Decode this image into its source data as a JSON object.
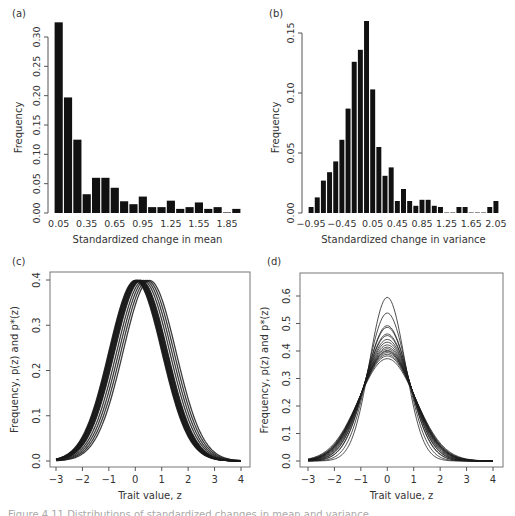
{
  "figure": {
    "caption": "Figure 4.11 Distributions of standardized changes in mean and variance"
  },
  "chart_data": [
    {
      "id": "a",
      "panel_label": "(a)",
      "type": "bar",
      "title": "",
      "xlabel": "Standardized change in mean",
      "ylabel": "Frequency",
      "ylim": [
        0,
        0.33
      ],
      "yticks": [
        0.0,
        0.05,
        0.1,
        0.15,
        0.2,
        0.25,
        0.3
      ],
      "ytick_labels": [
        "0.00",
        "0.05",
        "0.10",
        "0.15",
        "0.20",
        "0.25",
        "0.30"
      ],
      "xtick_labels": [
        "0.05",
        "0.35",
        "0.65",
        "0.95",
        "1.25",
        "1.55",
        "1.85"
      ],
      "xtick_every": 3,
      "grid": false,
      "categories": [
        "0.05",
        "0.15",
        "0.25",
        "0.35",
        "0.45",
        "0.55",
        "0.65",
        "0.75",
        "0.85",
        "0.95",
        "1.05",
        "1.15",
        "1.25",
        "1.35",
        "1.45",
        "1.55",
        "1.65",
        "1.75",
        "1.85",
        "1.95"
      ],
      "values": [
        0.325,
        0.197,
        0.125,
        0.032,
        0.06,
        0.06,
        0.043,
        0.02,
        0.015,
        0.028,
        0.01,
        0.01,
        0.021,
        0.007,
        0.01,
        0.018,
        0.007,
        0.01,
        0.001,
        0.007
      ],
      "bar_color": "#111111"
    },
    {
      "id": "b",
      "panel_label": "(b)",
      "type": "bar",
      "title": "",
      "xlabel": "Standardized change in variance",
      "ylabel": "Frequency",
      "ylim": [
        0,
        0.16
      ],
      "yticks": [
        0.0,
        0.05,
        0.1,
        0.15
      ],
      "ytick_labels": [
        "0.00",
        "0.05",
        "0.10",
        "0.15"
      ],
      "xtick_labels": [
        "−0.95",
        "−0.45",
        "0.05",
        "0.45",
        "0.85",
        "1.25",
        "1.65",
        "2.05"
      ],
      "xtick_positions": [
        0,
        5,
        10,
        14,
        18,
        22,
        26,
        30
      ],
      "grid": false,
      "categories": [
        "-0.95",
        "-0.85",
        "-0.75",
        "-0.65",
        "-0.55",
        "-0.45",
        "-0.35",
        "-0.25",
        "-0.15",
        "-0.05",
        "0.05",
        "0.15",
        "0.25",
        "0.35",
        "0.45",
        "0.55",
        "0.65",
        "0.75",
        "0.85",
        "0.95",
        "1.05",
        "1.15",
        "1.25",
        "1.35",
        "1.45",
        "1.55",
        "1.65",
        "1.75",
        "1.85",
        "1.95",
        "2.05"
      ],
      "values": [
        0.005,
        0.013,
        0.027,
        0.034,
        0.043,
        0.061,
        0.087,
        0.126,
        0.136,
        0.16,
        0.103,
        0.055,
        0.031,
        0.038,
        0.01,
        0.02,
        0.01,
        0.006,
        0.011,
        0.011,
        0.006,
        0.005,
        0.0,
        0.0,
        0.005,
        0.005,
        0.0,
        0.0,
        0.0,
        0.005,
        0.01
      ],
      "bar_color": "#111111"
    },
    {
      "id": "c",
      "panel_label": "(c)",
      "type": "line",
      "title": "",
      "xlabel": "Trait value, z",
      "ylabel": "Frequency, p(z) and p*(z)",
      "xlim": [
        -3,
        4
      ],
      "ylim": [
        0,
        0.4
      ],
      "xticks": [
        -3,
        -2,
        -1,
        0,
        1,
        2,
        3,
        4
      ],
      "xtick_labels": [
        "−3",
        "−2",
        "−1",
        "0",
        "1",
        "2",
        "3",
        "4"
      ],
      "yticks": [
        0.0,
        0.1,
        0.2,
        0.3,
        0.4
      ],
      "ytick_labels": [
        "0.0",
        "0.1",
        "0.2",
        "0.3",
        "0.4"
      ],
      "grid": false,
      "series_description": "Normal density curves with SD = 1 and shifted means",
      "series": [
        {
          "name": "curve",
          "mean": 0.0,
          "sd": 1.0
        },
        {
          "name": "curve",
          "mean": 0.02,
          "sd": 1.0
        },
        {
          "name": "curve",
          "mean": 0.04,
          "sd": 1.0
        },
        {
          "name": "curve",
          "mean": 0.05,
          "sd": 1.0
        },
        {
          "name": "curve",
          "mean": 0.06,
          "sd": 1.0
        },
        {
          "name": "curve",
          "mean": 0.08,
          "sd": 1.0
        },
        {
          "name": "curve",
          "mean": 0.1,
          "sd": 1.0
        },
        {
          "name": "curve",
          "mean": 0.12,
          "sd": 1.0
        },
        {
          "name": "curve",
          "mean": 0.14,
          "sd": 1.0
        },
        {
          "name": "curve",
          "mean": 0.16,
          "sd": 1.0
        },
        {
          "name": "curve",
          "mean": 0.18,
          "sd": 1.0
        },
        {
          "name": "curve",
          "mean": 0.2,
          "sd": 1.0
        },
        {
          "name": "curve",
          "mean": 0.22,
          "sd": 1.0
        },
        {
          "name": "curve",
          "mean": 0.3,
          "sd": 1.0
        },
        {
          "name": "curve",
          "mean": 0.38,
          "sd": 1.0
        },
        {
          "name": "curve",
          "mean": 0.46,
          "sd": 1.0
        },
        {
          "name": "curve",
          "mean": 0.54,
          "sd": 1.0
        }
      ]
    },
    {
      "id": "d",
      "panel_label": "(d)",
      "type": "line",
      "title": "",
      "xlabel": "Trait value, z",
      "ylabel": "Frequency, p(z) and p*(z)",
      "xlim": [
        -3,
        4
      ],
      "ylim": [
        0,
        0.6
      ],
      "xticks": [
        -3,
        -2,
        -1,
        0,
        1,
        2,
        3,
        4
      ],
      "xtick_labels": [
        "−3",
        "−2",
        "−1",
        "0",
        "1",
        "2",
        "3",
        "4"
      ],
      "yticks": [
        0.0,
        0.1,
        0.2,
        0.3,
        0.4,
        0.5,
        0.6
      ],
      "ytick_labels": [
        "0.0",
        "0.1",
        "0.2",
        "0.3",
        "0.4",
        "0.5",
        "0.6"
      ],
      "grid": false,
      "series_description": "Normal density curves centered at 0 with varying peak heights",
      "series": [
        {
          "name": "curve",
          "mean": 0,
          "peak": 0.595
        },
        {
          "name": "curve",
          "mean": 0,
          "peak": 0.538
        },
        {
          "name": "curve",
          "mean": 0,
          "peak": 0.492
        },
        {
          "name": "curve",
          "mean": 0,
          "peak": 0.486
        },
        {
          "name": "curve",
          "mean": 0,
          "peak": 0.462
        },
        {
          "name": "curve",
          "mean": 0,
          "peak": 0.456
        },
        {
          "name": "curve",
          "mean": 0,
          "peak": 0.442
        },
        {
          "name": "curve",
          "mean": 0,
          "peak": 0.432
        },
        {
          "name": "curve",
          "mean": 0,
          "peak": 0.422
        },
        {
          "name": "curve",
          "mean": 0,
          "peak": 0.414
        },
        {
          "name": "curve",
          "mean": 0,
          "peak": 0.408
        },
        {
          "name": "curve",
          "mean": 0,
          "peak": 0.402
        },
        {
          "name": "curve",
          "mean": 0,
          "peak": 0.399
        },
        {
          "name": "curve",
          "mean": 0,
          "peak": 0.394
        },
        {
          "name": "curve",
          "mean": 0,
          "peak": 0.388
        },
        {
          "name": "curve",
          "mean": 0,
          "peak": 0.382
        },
        {
          "name": "curve",
          "mean": 0,
          "peak": 0.372
        }
      ]
    }
  ]
}
